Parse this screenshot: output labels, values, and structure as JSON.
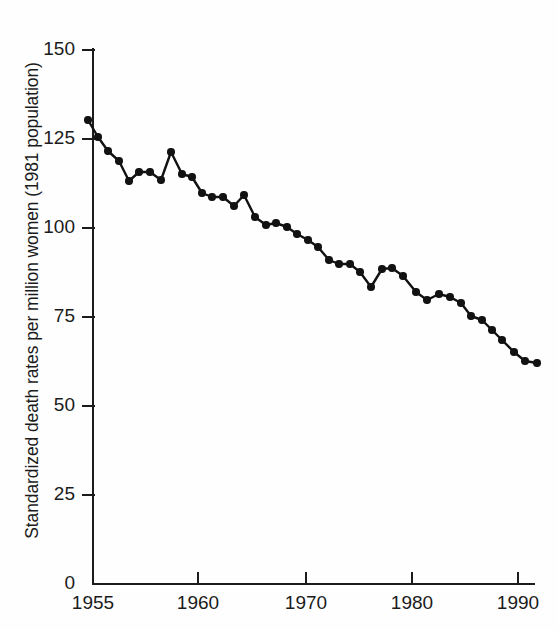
{
  "figure": {
    "background": "#ffffff",
    "ink": "#1b1b1b",
    "marker_color": "#121212"
  },
  "axes": {
    "ylabel": "Standardized death rates per million women (1981 population)",
    "yticks": [
      0,
      25,
      50,
      75,
      100,
      125,
      150
    ],
    "ytick_labels": [
      "0",
      "25",
      "50",
      "75",
      "100",
      "125",
      "150"
    ],
    "xticks": [
      1955,
      1960,
      1970,
      1980,
      1990
    ],
    "xtick_labels": [
      "1955",
      "1960",
      "1970",
      "1980",
      "1990"
    ],
    "ylim": [
      0,
      150
    ],
    "xlim": [
      1955,
      1992
    ],
    "grid": false
  },
  "chart_data": {
    "type": "line",
    "title": "",
    "xlabel": "",
    "ylabel": "Standardized death rates per million women (1981 population)",
    "ylim": [
      0,
      150
    ],
    "xlim": [
      1955,
      1992
    ],
    "grid": false,
    "legend": null,
    "marker": "filled-circle",
    "x": [
      1955,
      1956,
      1957,
      1958,
      1959,
      1960,
      1961,
      1962,
      1963,
      1964,
      1965,
      1966,
      1967,
      1968,
      1969,
      1970,
      1971,
      1972,
      1973,
      1974,
      1975,
      1976,
      1977,
      1978,
      1979,
      1980,
      1981,
      1982,
      1983,
      1984,
      1985,
      1986,
      1987,
      1988,
      1989,
      1990,
      1991,
      1992
    ],
    "y": [
      130,
      126,
      122,
      119,
      113,
      116,
      116,
      113.5,
      121,
      115,
      114,
      110,
      109,
      109,
      106,
      109,
      103,
      101,
      101.5,
      100,
      98,
      96.5,
      94.5,
      91,
      90,
      90,
      88,
      84,
      89,
      89,
      87,
      82,
      79,
      80,
      79,
      77,
      73,
      70
    ],
    "y_units": "deaths per million women",
    "series": [
      {
        "name": "Standardized death rate",
        "values": [
          130,
          126,
          122,
          119,
          113,
          116,
          116,
          113.5,
          121,
          115,
          114,
          110,
          109,
          109,
          106,
          109,
          103,
          101,
          101.5,
          100,
          98,
          96.5,
          94.5,
          91,
          90,
          90,
          88,
          84,
          89,
          89,
          87,
          82,
          79,
          80,
          79,
          77,
          73,
          70
        ]
      }
    ],
    "points_px": [
      [
        88,
        120
      ],
      [
        98,
        137
      ],
      [
        108,
        151
      ],
      [
        119,
        161
      ],
      [
        129,
        181
      ],
      [
        139,
        172
      ],
      [
        150,
        172
      ],
      [
        161,
        180
      ],
      [
        171,
        152
      ],
      [
        182,
        174
      ],
      [
        192,
        177
      ],
      [
        202,
        193
      ],
      [
        212,
        197
      ],
      [
        223,
        197
      ],
      [
        234,
        206
      ],
      [
        244,
        195
      ],
      [
        255,
        217
      ],
      [
        266,
        225
      ],
      [
        276,
        223
      ],
      [
        287,
        227
      ],
      [
        297,
        234
      ],
      [
        308,
        240
      ],
      [
        318,
        247
      ],
      [
        329,
        260
      ],
      [
        339,
        264
      ],
      [
        350,
        264
      ],
      [
        360,
        272
      ],
      [
        371,
        287
      ],
      [
        382,
        269
      ],
      [
        392,
        268
      ],
      [
        403,
        276
      ],
      [
        416,
        292
      ],
      [
        427,
        300
      ],
      [
        439,
        294
      ],
      [
        450,
        297
      ],
      [
        461,
        303
      ],
      [
        471,
        316
      ],
      [
        482,
        320
      ],
      [
        492,
        330
      ],
      [
        502,
        340
      ],
      [
        514,
        352
      ],
      [
        525,
        361
      ],
      [
        537,
        363
      ]
    ]
  }
}
